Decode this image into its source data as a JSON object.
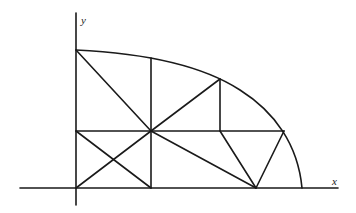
{
  "diagram": {
    "type": "quarter-disk mesh / triangulation",
    "axes": {
      "x_label": "x",
      "y_label": "y"
    },
    "origin_px": [
      76,
      188
    ],
    "boundary_curve": {
      "from": [
        76,
        50
      ],
      "through": [
        [
          151,
          58
        ],
        [
          220,
          79
        ],
        [
          284,
          131
        ]
      ],
      "to": [
        302,
        188
      ]
    },
    "nodes": {
      "O": [
        76,
        188
      ],
      "A_top": [
        76,
        50
      ],
      "B_mid_left": [
        76,
        131
      ],
      "C_center": [
        151,
        131
      ],
      "D_top_mid": [
        151,
        58
      ],
      "E_curve": [
        220,
        79
      ],
      "F_mid_right_line": [
        220,
        131
      ],
      "G_curve_right": [
        284,
        131
      ],
      "H_bottom_mid": [
        151,
        188
      ],
      "I_bottom_apex": [
        256,
        188
      ],
      "J_curve_end": [
        302,
        188
      ]
    },
    "edges": [
      [
        "A_top",
        "C_center"
      ],
      [
        "D_top_mid",
        "H_bottom_mid"
      ],
      [
        "C_center",
        "E_curve"
      ],
      [
        "E_curve",
        "F_mid_right_line"
      ],
      [
        "B_mid_left",
        "G_curve_right"
      ],
      [
        "B_mid_left",
        "H_bottom_mid"
      ],
      [
        "O",
        "C_center"
      ],
      [
        "C_center",
        "I_bottom_apex"
      ],
      [
        "F_mid_right_line",
        "I_bottom_apex"
      ],
      [
        "G_curve_right",
        "I_bottom_apex"
      ]
    ]
  }
}
